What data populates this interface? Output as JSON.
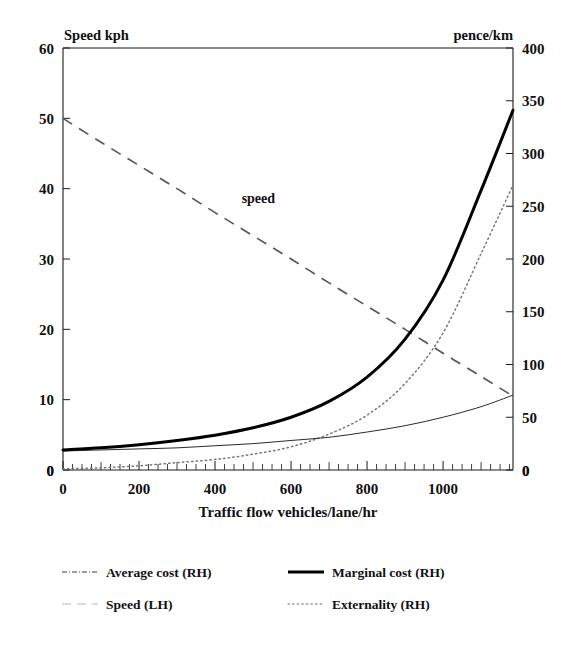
{
  "chart_data": {
    "type": "line",
    "title": "",
    "xlabel": "Traffic flow vehicles/lane/hr",
    "ylabel_left": "Speed kph",
    "ylabel_right": "pence/km",
    "xlim": [
      0,
      1184
    ],
    "ylim_left": [
      0,
      60
    ],
    "ylim_right": [
      0,
      400
    ],
    "grid": false,
    "legend_position": "below",
    "xticks": [
      0,
      200,
      400,
      600,
      800,
      1000
    ],
    "xticklabels": [
      "0",
      "200",
      "400",
      "600",
      "800",
      "1000"
    ],
    "yticks_left": [
      0,
      10,
      20,
      30,
      40,
      50,
      60
    ],
    "yticklabels_left": [
      "0",
      "10",
      "20",
      "30",
      "40",
      "50",
      "60"
    ],
    "yticks_right": [
      0,
      50,
      100,
      150,
      200,
      250,
      300,
      350,
      400
    ],
    "yticklabels_right": [
      "0",
      "50",
      "100",
      "150",
      "200",
      "250",
      "300",
      "350",
      "400"
    ],
    "annotations": [
      {
        "text": "speed",
        "x": 470,
        "y": 38,
        "axis": "left"
      }
    ],
    "series": [
      {
        "name": "Speed (LH)",
        "axis": "left",
        "style": "dashed",
        "x": [
          0,
          100,
          200,
          300,
          400,
          500,
          600,
          700,
          800,
          900,
          1000,
          1100,
          1184
        ],
        "values": [
          50.0,
          46.6,
          43.3,
          40.0,
          36.6,
          33.3,
          30.0,
          26.6,
          23.3,
          20.0,
          16.6,
          13.3,
          10.5
        ]
      },
      {
        "name": "Average cost (RH)",
        "axis": "right",
        "style": "thin-solid",
        "x": [
          0,
          100,
          200,
          300,
          400,
          500,
          600,
          700,
          800,
          900,
          1000,
          1100,
          1184
        ],
        "values": [
          18,
          19,
          20,
          21,
          23,
          25,
          28,
          31,
          36,
          42,
          50,
          60,
          71
        ]
      },
      {
        "name": "Marginal cost (RH)",
        "axis": "right",
        "style": "thick-solid",
        "x": [
          0,
          100,
          200,
          300,
          400,
          500,
          600,
          700,
          800,
          900,
          1000,
          1100,
          1184
        ],
        "values": [
          19,
          21,
          24,
          28,
          33,
          40,
          50,
          65,
          88,
          124,
          180,
          265,
          341
        ]
      },
      {
        "name": "Externality (RH)",
        "axis": "right",
        "style": "dotted",
        "x": [
          0,
          100,
          200,
          300,
          400,
          500,
          600,
          700,
          800,
          900,
          1000,
          1100,
          1184
        ],
        "values": [
          1,
          2,
          4,
          7,
          10,
          15,
          22,
          34,
          52,
          82,
          130,
          205,
          270
        ]
      }
    ]
  },
  "axes": {
    "left_corner_label": "Speed kph",
    "right_corner_label": "pence/km",
    "xaxis_title": "Traffic flow vehicles/lane/hr",
    "bottom_left_zero": "0",
    "bottom_right_zero": "0"
  },
  "legend": {
    "entries": [
      {
        "label": "Average cost (RH)",
        "style": "dashdot"
      },
      {
        "label": "Marginal cost (RH)",
        "style": "solid"
      },
      {
        "label": "Speed (LH)",
        "style": "dash"
      },
      {
        "label": "Externality (RH)",
        "style": "dot"
      }
    ]
  },
  "colors": {
    "ink": "#111111",
    "marginal": "#000000",
    "average": "#2b2b2b",
    "speed": "#555555",
    "externality": "#777777",
    "background": "#ffffff"
  }
}
